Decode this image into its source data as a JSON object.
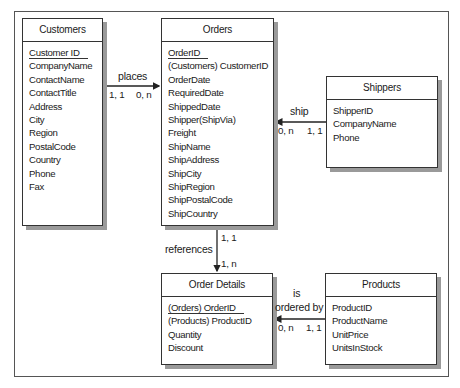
{
  "diagram": {
    "type": "entity-relationship",
    "entities": [
      {
        "id": "customers",
        "title": "Customers",
        "fields": [
          "Customer ID",
          "CompanyName",
          "ContactName",
          "ContactTitle",
          "Address",
          "City",
          "Region",
          "PostalCode",
          "Country",
          "Phone",
          "Fax"
        ],
        "key_fields": [
          "Customer ID"
        ]
      },
      {
        "id": "orders",
        "title": "Orders",
        "fields": [
          "OrderID",
          "(Customers) CustomerID",
          "OrderDate",
          "RequiredDate",
          "ShippedDate",
          "Shipper(ShipVia)",
          "Freight",
          "ShipName",
          "ShipAddress",
          "ShipCity",
          "ShipRegion",
          "ShipPostalCode",
          "ShipCountry"
        ],
        "key_fields": [
          "OrderID"
        ]
      },
      {
        "id": "shippers",
        "title": "Shippers",
        "fields": [
          "ShipperID",
          "CompanyName",
          "Phone"
        ],
        "key_fields": []
      },
      {
        "id": "order_details",
        "title": "Order Details",
        "fields": [
          "(Orders) OrderID",
          "(Products) ProductID",
          "Quantity",
          "Discount"
        ],
        "key_fields": [
          "(Orders) OrderID"
        ]
      },
      {
        "id": "products",
        "title": "Products",
        "fields": [
          "ProductID",
          "ProductName",
          "UnitPrice",
          "UnitsInStock"
        ],
        "key_fields": []
      }
    ],
    "relationships": [
      {
        "from": "customers",
        "to": "orders",
        "label": "places",
        "from_card": "1, 1",
        "to_card": "0, n"
      },
      {
        "from": "shippers",
        "to": "orders",
        "label": "ship",
        "from_card": "1, 1",
        "to_card": "0, n"
      },
      {
        "from": "orders",
        "to": "order_details",
        "label": "references",
        "from_card": "1, 1",
        "to_card": "1, n"
      },
      {
        "from": "products",
        "to": "order_details",
        "label_line1": "is",
        "label_line2": "ordered by",
        "from_card": "1, 1",
        "to_card": "0, n"
      }
    ]
  }
}
